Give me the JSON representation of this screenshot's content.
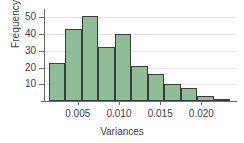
{
  "chart_data": {
    "type": "bar",
    "title": "",
    "xlabel": "Variances",
    "ylabel": "Frequency",
    "categories": [
      "0.0025",
      "0.0045",
      "0.0065",
      "0.0085",
      "0.0105",
      "0.0125",
      "0.0145",
      "0.0165",
      "0.0185",
      "0.0205",
      "0.0225"
    ],
    "bin_edges": [
      0.0015,
      0.0035,
      0.0055,
      0.0075,
      0.0095,
      0.0115,
      0.0135,
      0.0155,
      0.0175,
      0.0195,
      0.0215,
      0.0235
    ],
    "values": [
      23,
      43,
      51,
      32,
      40,
      21,
      16,
      10,
      8,
      3,
      1
    ],
    "xlim": [
      0.0009,
      0.0242
    ],
    "ylim": [
      0,
      55
    ],
    "xticks": [
      0.005,
      0.01,
      0.015,
      0.02
    ],
    "xtick_labels": [
      "0.005",
      "0.010",
      "0.015",
      "0.020"
    ],
    "yticks": [
      10,
      20,
      30,
      40,
      50
    ],
    "ytick_labels": [
      "10",
      "20",
      "30",
      "40",
      "50"
    ],
    "grid": "horizontal-light",
    "legend": "none",
    "bar_fill_color": "#8fbd98",
    "bar_edge_color": "#3c3c3c",
    "axis_color": "#6d6d6d",
    "text_color": "#3f3f3f"
  }
}
